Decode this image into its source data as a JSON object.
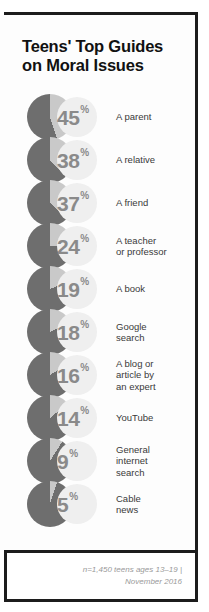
{
  "title": {
    "line1": "Teens' Top Guides",
    "line2": "on Moral Issues"
  },
  "footer": {
    "line1": "n=1,450 teens ages 13–19 |",
    "line2": "November 2016"
  },
  "colors": {
    "pie_dark": "#6e6e6e",
    "pie_light": "#c9c9c9",
    "bubble": "#efefef",
    "number": "#8a8a8a",
    "label": "#3a3a3a",
    "rule": "#1c1c1c"
  },
  "chart_data": {
    "type": "pie",
    "title": "Teens' Top Guides on Moral Issues",
    "subtitle": "",
    "xlabel": "",
    "ylabel": "",
    "unit": "%",
    "note": "n=1,450 teens ages 13–19 | November 2016",
    "categories": [
      "A parent",
      "A relative",
      "A friend",
      "A teacher or professor",
      "A book",
      "Google search",
      "A blog or article by an expert",
      "YouTube",
      "General internet search",
      "Cable news"
    ],
    "values": [
      45,
      38,
      37,
      24,
      19,
      18,
      16,
      14,
      9,
      5
    ],
    "rows": [
      {
        "value": 45,
        "value_text": "45",
        "pct_sign": "%",
        "label_lines": [
          "A parent"
        ]
      },
      {
        "value": 38,
        "value_text": "38",
        "pct_sign": "%",
        "label_lines": [
          "A relative"
        ]
      },
      {
        "value": 37,
        "value_text": "37",
        "pct_sign": "%",
        "label_lines": [
          "A friend"
        ]
      },
      {
        "value": 24,
        "value_text": "24",
        "pct_sign": "%",
        "label_lines": [
          "A teacher",
          "or professor"
        ]
      },
      {
        "value": 19,
        "value_text": "19",
        "pct_sign": "%",
        "label_lines": [
          "A book"
        ]
      },
      {
        "value": 18,
        "value_text": "18",
        "pct_sign": "%",
        "label_lines": [
          "Google",
          "search"
        ]
      },
      {
        "value": 16,
        "value_text": "16",
        "pct_sign": "%",
        "label_lines": [
          "A blog or",
          "article by",
          "an expert"
        ]
      },
      {
        "value": 14,
        "value_text": "14",
        "pct_sign": "%",
        "label_lines": [
          "YouTube"
        ]
      },
      {
        "value": 9,
        "value_text": "9",
        "pct_sign": "%",
        "label_lines": [
          "General",
          "internet",
          "search"
        ]
      },
      {
        "value": 5,
        "value_text": "5",
        "pct_sign": "%",
        "label_lines": [
          "Cable",
          "news"
        ]
      }
    ]
  }
}
